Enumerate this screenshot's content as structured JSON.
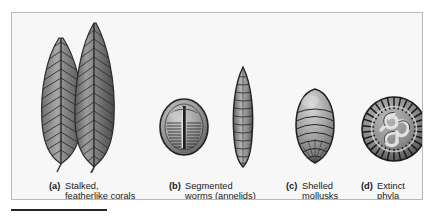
{
  "figure": {
    "background_color": "#f7f7f7",
    "border_color": "#b9b9b9",
    "rule_color": "#20242c",
    "items": [
      {
        "tag": "(a)",
        "line1": "Stalked,",
        "line2": "featherlike corals",
        "specimen_count": 2,
        "specimen_names": [
          "frond-fossil-small",
          "frond-fossil-large"
        ]
      },
      {
        "tag": "(b)",
        "line1": "Segmented",
        "line2": "worms (annelids)",
        "specimen_count": 2,
        "specimen_names": [
          "oval-worm-fossil",
          "spindle-worm-fossil"
        ]
      },
      {
        "tag": "(c)",
        "line1": "Shelled",
        "line2": "mollusks",
        "specimen_count": 1,
        "specimen_names": [
          "mollusk-shell-fossil"
        ]
      },
      {
        "tag": "(d)",
        "line1": "Extinct",
        "line2": "phyla",
        "specimen_count": 1,
        "specimen_names": [
          "discoid-extinct-fossil"
        ]
      }
    ]
  }
}
